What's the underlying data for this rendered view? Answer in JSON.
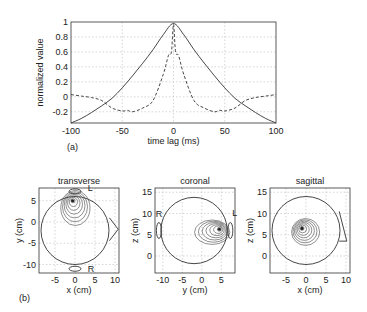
{
  "chart_data": [
    {
      "type": "line",
      "panel_label": "(a)",
      "title": "",
      "xlabel": "time lag (ms)",
      "ylabel": "normalized value",
      "xlim": [
        -100,
        100
      ],
      "ylim": [
        -0.35,
        1
      ],
      "xticks": [
        -100,
        -50,
        0,
        50,
        100
      ],
      "yticks": [
        -0.2,
        0,
        0.2,
        0.4,
        0.6,
        0.8,
        1
      ],
      "ytick_labels": [
        "-0.2",
        "0",
        "0.2",
        "0.4",
        "0.6",
        "0.8",
        "1"
      ],
      "xtick_labels": [
        "-100",
        "-50",
        "0",
        "50",
        "100"
      ],
      "grid": true,
      "series": [
        {
          "name": "solid",
          "style": "solid",
          "x": [
            -100,
            -90,
            -80,
            -70,
            -60,
            -50,
            -40,
            -30,
            -20,
            -10,
            0,
            10,
            20,
            30,
            40,
            50,
            60,
            70,
            80,
            90,
            100
          ],
          "values": [
            -0.35,
            -0.29,
            -0.21,
            -0.12,
            -0.02,
            0.12,
            0.28,
            0.45,
            0.63,
            0.83,
            0.98,
            0.83,
            0.63,
            0.45,
            0.28,
            0.12,
            -0.02,
            -0.12,
            -0.21,
            -0.29,
            -0.35
          ]
        },
        {
          "name": "dashed",
          "style": "dashed",
          "x": [
            -100,
            -90,
            -80,
            -70,
            -60,
            -50,
            -45,
            -40,
            -30,
            -20,
            -10,
            -5,
            -2,
            0,
            2,
            5,
            10,
            20,
            30,
            40,
            45,
            50,
            60,
            70,
            80,
            90,
            100
          ],
          "values": [
            0.03,
            0.01,
            -0.01,
            -0.05,
            -0.15,
            -0.19,
            -0.18,
            -0.2,
            -0.15,
            -0.05,
            0.3,
            0.55,
            0.6,
            0.97,
            0.6,
            0.55,
            0.3,
            -0.05,
            -0.15,
            -0.2,
            -0.18,
            -0.19,
            -0.15,
            -0.05,
            -0.01,
            0.01,
            0.03
          ]
        }
      ]
    },
    {
      "type": "contour",
      "panel_label": "(b)",
      "title": "transverse",
      "xlabel": "x (cm)",
      "ylabel": "y (cm)",
      "xticks": [
        -5,
        0,
        5,
        10
      ],
      "yticks": [
        -10,
        -5,
        0,
        5
      ],
      "xlim": [
        -9,
        11
      ],
      "ylim": [
        -12,
        8
      ],
      "annotations": [
        "L",
        "R"
      ]
    },
    {
      "type": "contour",
      "title": "coronal",
      "xlabel": "y (cm)",
      "ylabel": "z (cm)",
      "xticks": [
        -10,
        -5,
        0,
        5
      ],
      "yticks": [
        0,
        5,
        10,
        15
      ],
      "xlim": [
        -12,
        8.5
      ],
      "ylim": [
        -4,
        16
      ],
      "annotations": [
        "R",
        "L"
      ]
    },
    {
      "type": "contour",
      "title": "sagittal",
      "xlabel": "x (cm)",
      "ylabel": "z (cm)",
      "xticks": [
        -5,
        0,
        5,
        10
      ],
      "yticks": [
        0,
        5,
        10,
        15
      ],
      "xlim": [
        -9,
        11
      ],
      "ylim": [
        -4,
        16
      ],
      "annotations": []
    }
  ]
}
